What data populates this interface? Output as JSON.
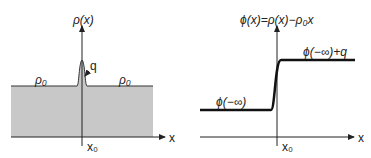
{
  "left_panel": {
    "y_axis_label": "ρ(x)",
    "x_axis_label": "x",
    "x0_label": "x₀",
    "rho0_left": "ρ₀",
    "rho0_right": "ρ₀",
    "peak_label": "q",
    "fill_color": "#c8c8c8"
  },
  "right_panel": {
    "y_axis_label": "ϕ(x)=ρ(x)−ρ₀x",
    "x_axis_label": "x",
    "x0_label": "x₀",
    "low_label": "ϕ(−∞)",
    "high_label": "ϕ(−∞)+q"
  }
}
